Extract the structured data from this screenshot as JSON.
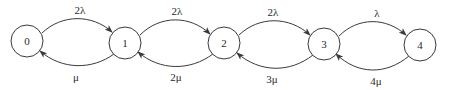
{
  "diagram": {
    "type": "state-transition-chain",
    "nodes": [
      {
        "id": "0",
        "label": "0",
        "cx": 27,
        "cy": 41,
        "r": 16
      },
      {
        "id": "1",
        "label": "1",
        "cx": 125,
        "cy": 43,
        "r": 16
      },
      {
        "id": "2",
        "label": "2",
        "cx": 224,
        "cy": 43,
        "r": 16
      },
      {
        "id": "3",
        "label": "3",
        "cx": 324,
        "cy": 44,
        "r": 16
      },
      {
        "id": "4",
        "label": "4",
        "cx": 420,
        "cy": 45,
        "r": 16
      }
    ],
    "forward_edges": [
      {
        "from": "0",
        "to": "1",
        "label": "2λ",
        "label_x": 80,
        "label_y": 10
      },
      {
        "from": "1",
        "to": "2",
        "label": "2λ",
        "label_x": 177,
        "label_y": 11
      },
      {
        "from": "2",
        "to": "3",
        "label": "2λ",
        "label_x": 273,
        "label_y": 12
      },
      {
        "from": "3",
        "to": "4",
        "label": "λ",
        "label_x": 377,
        "label_y": 13
      }
    ],
    "backward_edges": [
      {
        "from": "1",
        "to": "0",
        "label": "μ",
        "label_x": 76,
        "label_y": 77
      },
      {
        "from": "2",
        "to": "1",
        "label": "2μ",
        "label_x": 176,
        "label_y": 77
      },
      {
        "from": "3",
        "to": "2",
        "label": "3μ",
        "label_x": 272,
        "label_y": 79
      },
      {
        "from": "4",
        "to": "3",
        "label": "4μ",
        "label_x": 376,
        "label_y": 81
      }
    ]
  }
}
